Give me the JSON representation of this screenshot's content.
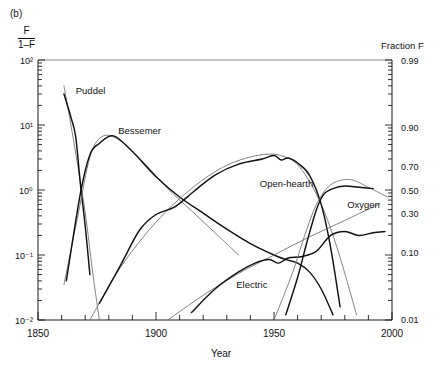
{
  "panel": {
    "tag": "(b)"
  },
  "axes": {
    "left_label_numerator": "F",
    "left_label_denominator": "1–F",
    "right_label": "Fraction F",
    "x_label": "Year",
    "left_ticks": [
      "10²",
      "10¹",
      "10⁰",
      "10⁻¹",
      "10⁻²"
    ],
    "left_tick_values": [
      100,
      10,
      1,
      0.1,
      0.01
    ],
    "right_ticks": [
      "0.99",
      "0.90",
      "0.70",
      "0.50",
      "0.30",
      "0.10",
      "0.01"
    ],
    "right_tick_values": [
      0.99,
      0.9,
      0.7,
      0.5,
      0.3,
      0.1,
      0.01
    ],
    "x_ticks": [
      "1850",
      "1900",
      "1950",
      "2000"
    ],
    "x_tick_values": [
      1850,
      1900,
      1950,
      2000
    ],
    "x_minor_step": 10
  },
  "curve_labels": {
    "puddel": "Puddel",
    "bessemer": "Bessemer",
    "open_hearth": "Open-hearth",
    "electric": "Electric",
    "oxygen": "Oxygen"
  },
  "chart_data": {
    "type": "line",
    "title": "",
    "subtitle": "",
    "xlabel": "Year",
    "ylabel": "F / (1–F)",
    "ylabel_right": "Fraction F",
    "xlim": [
      1850,
      2000
    ],
    "ylim": [
      0.01,
      100
    ],
    "yscale": "log",
    "grid": false,
    "legend": "inline-annotations",
    "annotations": [
      {
        "text": "Puddel",
        "x": 1866,
        "y": 30
      },
      {
        "text": "Bessemer",
        "x": 1884,
        "y": 7.2
      },
      {
        "text": "Open-hearth",
        "x": 1944,
        "y": 1.1
      },
      {
        "text": "Electric",
        "x": 1934,
        "y": 0.031
      },
      {
        "text": "Oxygen",
        "x": 1981,
        "y": 0.52
      }
    ],
    "series": [
      {
        "name": "Puddel (logistic fit)",
        "style": "thin-gray",
        "x": [
          1861,
          1865,
          1870,
          1873,
          1876
        ],
        "y": [
          40,
          6.0,
          0.45,
          0.06,
          0.01
        ]
      },
      {
        "name": "Puddel (data)",
        "style": "thick-black",
        "x": [
          1861,
          1864,
          1866,
          1868,
          1870,
          1872
        ],
        "y": [
          30,
          13,
          6.5,
          1.2,
          0.28,
          0.05
        ]
      },
      {
        "name": "Bessemer (logistic fit)",
        "style": "thin-gray",
        "x": [
          1861,
          1867,
          1872,
          1877,
          1884,
          1895,
          1905,
          1915,
          1925,
          1935
        ],
        "y": [
          0.035,
          0.42,
          3.2,
          6.6,
          6.0,
          2.6,
          1.05,
          0.48,
          0.22,
          0.1
        ]
      },
      {
        "name": "Bessemer (data)",
        "style": "thick-black",
        "x": [
          1862,
          1868,
          1872,
          1876,
          1882,
          1890,
          1900,
          1910,
          1920,
          1930,
          1940,
          1950,
          1955,
          1960,
          1965,
          1970,
          1975
        ],
        "y": [
          0.04,
          0.9,
          3.5,
          5.2,
          6.8,
          3.9,
          1.6,
          0.78,
          0.44,
          0.25,
          0.15,
          0.1,
          0.085,
          0.075,
          0.055,
          0.03,
          0.012
        ]
      },
      {
        "name": "Open-hearth (logistic fit)",
        "style": "thin-gray",
        "x": [
          1872,
          1885,
          1900,
          1915,
          1930,
          1945,
          1955,
          1962,
          1970,
          1977,
          1985
        ],
        "y": [
          0.01,
          0.065,
          0.32,
          1.05,
          2.4,
          3.5,
          3.2,
          2.0,
          0.6,
          0.12,
          0.012
        ]
      },
      {
        "name": "Open-hearth (data)",
        "style": "thick-black",
        "x": [
          1876,
          1885,
          1893,
          1900,
          1908,
          1916,
          1925,
          1935,
          1945,
          1950,
          1953,
          1956,
          1960,
          1965,
          1970,
          1974,
          1978
        ],
        "y": [
          0.018,
          0.07,
          0.24,
          0.42,
          0.55,
          0.95,
          1.7,
          2.5,
          3.0,
          3.4,
          2.9,
          3.1,
          2.6,
          1.7,
          0.6,
          0.13,
          0.016
        ]
      },
      {
        "name": "Electric (logistic fit)",
        "style": "thin-gray",
        "x": [
          1905,
          1920,
          1935,
          1950,
          1965,
          1980,
          1995
        ],
        "y": [
          0.01,
          0.024,
          0.052,
          0.1,
          0.19,
          0.34,
          0.62
        ]
      },
      {
        "name": "Electric (data)",
        "style": "thick-black",
        "x": [
          1915,
          1925,
          1935,
          1942,
          1948,
          1952,
          1956,
          1962,
          1968,
          1974,
          1980,
          1986,
          1992,
          1997
        ],
        "y": [
          0.013,
          0.03,
          0.055,
          0.075,
          0.085,
          0.075,
          0.09,
          0.095,
          0.115,
          0.2,
          0.23,
          0.2,
          0.22,
          0.23
        ]
      },
      {
        "name": "Oxygen (logistic fit)",
        "style": "thin-gray",
        "x": [
          1950,
          1958,
          1963,
          1968,
          1974,
          1982,
          1990,
          1998
        ],
        "y": [
          0.01,
          0.055,
          0.2,
          0.6,
          1.2,
          1.45,
          1.1,
          0.78
        ]
      },
      {
        "name": "Oxygen (data)",
        "style": "thick-black",
        "x": [
          1955,
          1960,
          1964,
          1968,
          1971,
          1975,
          1980,
          1986,
          1992
        ],
        "y": [
          0.012,
          0.045,
          0.16,
          0.5,
          0.85,
          1.05,
          1.15,
          1.1,
          1.05
        ]
      }
    ]
  }
}
